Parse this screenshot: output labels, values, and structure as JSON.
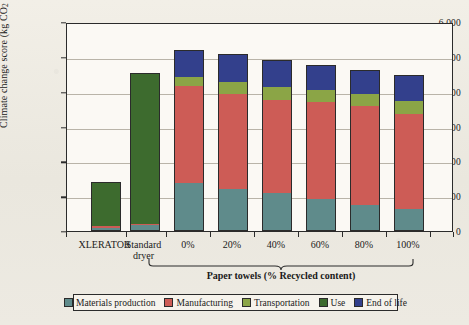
{
  "chart_data": {
    "type": "bar",
    "subtype": "stacked-vertical",
    "title": "",
    "xlabel": "Paper towels (% Recycled content)",
    "ylabel": "Climate change score (kg CO2 eq.)",
    "ylabel_rich": "Climate change score (kg CO₂ eq.)",
    "ylim": [
      0,
      6000
    ],
    "ytick_interval": 1000,
    "ytick_labels": [
      "6,000",
      "5,000",
      "4,000",
      "3,000",
      "2,000",
      "1,000",
      "0"
    ],
    "ytick_values": [
      6000,
      5000,
      4000,
      3000,
      2000,
      1000,
      0
    ],
    "grid": "horizontal",
    "legend_position": "bottom",
    "categories": [
      "XLERATOR",
      "Standard dryer",
      "0%",
      "20%",
      "40%",
      "60%",
      "80%",
      "100%"
    ],
    "category_labels": [
      [
        "XLERATOR"
      ],
      [
        "Standard",
        "dryer"
      ],
      [
        "0%"
      ],
      [
        "20%"
      ],
      [
        "40%"
      ],
      [
        "60%"
      ],
      [
        "80%"
      ],
      [
        "100%"
      ]
    ],
    "group_bracket": {
      "label": "Paper towels (% Recycled content)",
      "covers": [
        "0%",
        "20%",
        "40%",
        "60%",
        "80%",
        "100%"
      ]
    },
    "series": [
      {
        "name": "Materials production",
        "color": "#5f8b8b",
        "values": [
          100,
          170,
          1370,
          1210,
          1080,
          920,
          760,
          620
        ]
      },
      {
        "name": "Manufacturing",
        "color": "#cd5c56",
        "values": [
          40,
          40,
          2780,
          2710,
          2670,
          2790,
          2820,
          2730
        ]
      },
      {
        "name": "Transportation",
        "color": "#8ba546",
        "values": [
          0,
          0,
          280,
          370,
          390,
          340,
          350,
          390
        ]
      },
      {
        "name": "Use",
        "color": "#3d6b2e",
        "values": [
          1270,
          4340,
          0,
          0,
          0,
          0,
          0,
          0
        ]
      },
      {
        "name": "End of life",
        "color": "#33408c",
        "values": [
          0,
          0,
          770,
          790,
          760,
          730,
          700,
          740
        ]
      }
    ],
    "totals": [
      1410,
      4550,
      5200,
      5080,
      4900,
      4780,
      4630,
      4480
    ]
  },
  "legend": {
    "items": [
      {
        "label": "Materials production",
        "color": "#5f8b8b"
      },
      {
        "label": "Manufacturing",
        "color": "#cd5c56"
      },
      {
        "label": "Transportation",
        "color": "#8ba546"
      },
      {
        "label": "Use",
        "color": "#3d6b2e"
      },
      {
        "label": "End of life",
        "color": "#33408c"
      }
    ]
  },
  "colors": {
    "frame": "#2b2b2b",
    "grid": "#b9b4a8",
    "plot_bg": "#fbf9f4",
    "page_bg": "#efece4"
  }
}
